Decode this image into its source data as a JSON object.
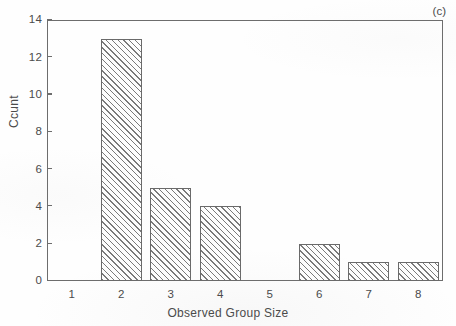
{
  "figure": {
    "panel_label": "(c)",
    "background_color": "#fefefe",
    "axis_color": "#6d6d6d",
    "bar_outline_color": "#6a6a6a",
    "bar_hatch_color": "#7a7a7a"
  },
  "chart_data": {
    "type": "bar",
    "title": "",
    "subtitle": "",
    "xlabel": "Observed Group Size",
    "ylabel": "Ccunt",
    "categories": [
      "1",
      "2",
      "3",
      "4",
      "5",
      "6",
      "7",
      "8"
    ],
    "values": [
      0,
      13,
      5,
      4,
      0,
      2,
      1,
      1
    ],
    "series": [
      {
        "name": "Count",
        "values": [
          0,
          13,
          5,
          4,
          0,
          2,
          1,
          1
        ]
      }
    ],
    "xlim": [
      0.5,
      8.5
    ],
    "ylim": [
      0,
      14
    ],
    "ytick_labels": [
      "0",
      "2",
      "4",
      "6",
      "8",
      "10",
      "12",
      "14"
    ],
    "ytick_values": [
      0,
      2,
      4,
      6,
      8,
      10,
      12,
      14
    ],
    "xtick_labels": [
      "1",
      "2",
      "3",
      "4",
      "5",
      "6",
      "7",
      "8"
    ],
    "xtick_values": [
      1,
      2,
      3,
      4,
      5,
      6,
      7,
      8
    ],
    "grid": false,
    "legend": false,
    "legend_position": "none",
    "annotations": [
      {
        "text": "(c)",
        "position": "top-right-inside"
      }
    ],
    "bar_fill": "diagonal-hatch-45deg",
    "bar_width_fraction": 0.82
  }
}
